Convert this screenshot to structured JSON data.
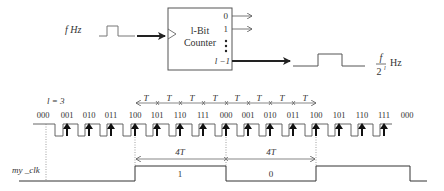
{
  "counter": {
    "input_label": "f Hz",
    "box_line1": "l-Bit",
    "box_line2": "Counter",
    "outputs": [
      "0",
      "1",
      "l −1"
    ],
    "output_label_num": "f",
    "output_label_den": "2",
    "output_label_den_exp": "l",
    "output_label_unit": "Hz"
  },
  "timing": {
    "l_label": "l = 3",
    "period_label": "T",
    "period_count": 8,
    "states": [
      "000",
      "001",
      "010",
      "011",
      "100",
      "101",
      "110",
      "111",
      "000",
      "001",
      "010",
      "011",
      "100",
      "101",
      "110",
      "111",
      "000"
    ],
    "signal_name": "my _clk",
    "half_period_labels": [
      "4T",
      "4T"
    ],
    "level_labels": [
      "1",
      "0"
    ]
  },
  "colors": {
    "line": "#333333",
    "thin": "#555555",
    "dotted": "#777777"
  }
}
